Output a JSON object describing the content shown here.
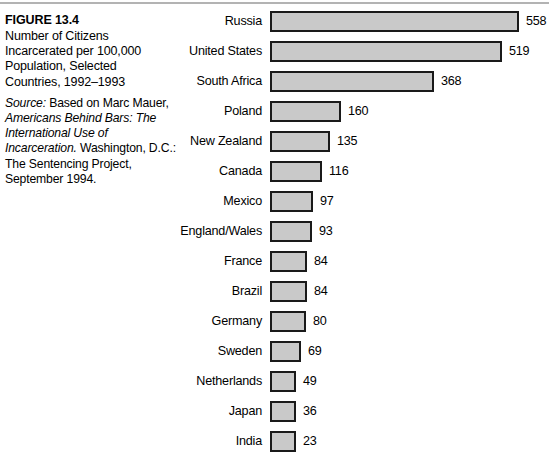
{
  "figure": {
    "number_label": "FIGURE 13.4",
    "title_lines": [
      "Number of Citizens",
      "Incarcerated per 100,000",
      "Population, Selected",
      "Countries, 1992–1993"
    ],
    "source": {
      "label": "Source:",
      "line1_rest": " Based on Marc Mauer,",
      "work_title_line1": "Americans Behind Bars: The",
      "work_title_line2": "International Use of",
      "work_title_line3": "Incarceration.",
      "line3_rest": " Washington, D.C.:",
      "line4": "The Sentencing Project,",
      "line5": "September 1994."
    }
  },
  "chart_data": {
    "type": "bar",
    "orientation": "horizontal",
    "title": "Number of Citizens Incarcerated per 100,000 Population, Selected Countries, 1992–1993",
    "xlabel": "",
    "ylabel": "",
    "grid": false,
    "legend": "none",
    "value_labels_shown": true,
    "xlim": [
      0,
      558
    ],
    "categories": [
      "Russia",
      "United States",
      "South Africa",
      "Poland",
      "New Zealand",
      "Canada",
      "Mexico",
      "England/Wales",
      "France",
      "Brazil",
      "Germany",
      "Sweden",
      "Netherlands",
      "Japan",
      "India"
    ],
    "values": [
      558,
      519,
      368,
      160,
      135,
      116,
      97,
      93,
      84,
      84,
      80,
      69,
      49,
      36,
      23
    ],
    "bar_fill_color": "#c9c9c9",
    "bar_border_color": "#1a1a1a"
  },
  "style": {
    "rule_color": "#b3b3b3"
  }
}
